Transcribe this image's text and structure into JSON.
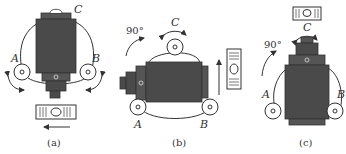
{
  "colors": {
    "body_dark": "#4a4a4a",
    "body_mid": "#5a5a5a",
    "line": "#333333",
    "background": "#ffffff"
  },
  "panels": [
    {
      "id": "a",
      "caption": "(a)",
      "labels": {
        "A": "A",
        "B": "B",
        "C": "C"
      },
      "vial_orientation": "horizontal",
      "arrow_direction": "left"
    },
    {
      "id": "b",
      "caption": "(b)",
      "labels": {
        "A": "A",
        "B": "B",
        "C": "C"
      },
      "rotation_label": "90°",
      "vial_orientation": "vertical",
      "arrow_direction": "up"
    },
    {
      "id": "c",
      "caption": "(c)",
      "labels": {
        "A": "A",
        "B": "B",
        "C": "C"
      },
      "rotation_label": "90°",
      "vial_orientation": "horizontal",
      "side_vial_orientation": "vertical"
    }
  ]
}
